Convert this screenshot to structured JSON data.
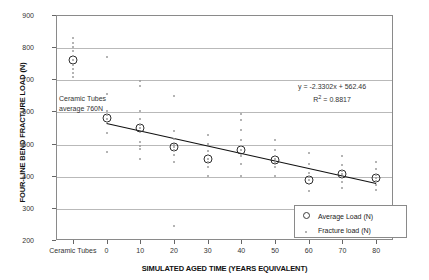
{
  "chart_data": {
    "type": "scatter",
    "title": "",
    "xlabel": "SIMULATED AGED TIME (YEARS EQUIVALENT)",
    "ylabel": "FOUR-LINE BEND FRACTURE LOAD (N)",
    "ylim": [
      200,
      900
    ],
    "ytick_labels": [
      "900",
      "800",
      "700",
      "600",
      "500",
      "400",
      "300",
      "200"
    ],
    "ytick_values": [
      900,
      800,
      700,
      600,
      500,
      400,
      300,
      200
    ],
    "xtick_labels": [
      "Ceramic\nTubes",
      "0",
      "10",
      "20",
      "30",
      "40",
      "50",
      "60",
      "70",
      "80"
    ],
    "xtick_values": [
      "ceramic",
      0,
      10,
      20,
      30,
      40,
      50,
      60,
      70,
      80
    ],
    "grid": true,
    "legend_position": "bottom-right",
    "annotation": "Ceramic Tubes\naverage 760N",
    "trendline_equation": "y = -2.3302x + 562.46",
    "trendline_r2_prefix": "R",
    "trendline_r2_sup": "2",
    "trendline_r2_value": " = 0.8817",
    "trendline_slope": -2.3302,
    "trendline_intercept": 562.46,
    "trendline_r2": 0.8817,
    "series": [
      {
        "name": "Average Load (N)",
        "marker": "open-circle",
        "color": "#2e2e2e",
        "points": [
          {
            "x": "ceramic",
            "y": 760
          },
          {
            "x": 0,
            "y": 580
          },
          {
            "x": 10,
            "y": 547
          },
          {
            "x": 20,
            "y": 489
          },
          {
            "x": 30,
            "y": 452
          },
          {
            "x": 40,
            "y": 480
          },
          {
            "x": 50,
            "y": 448
          },
          {
            "x": 60,
            "y": 388
          },
          {
            "x": 70,
            "y": 406
          },
          {
            "x": 80,
            "y": 392
          }
        ]
      },
      {
        "name": "Fracture load (N)",
        "marker": "dot",
        "color": "#9b9b9b",
        "points": [
          {
            "x": "ceramic",
            "y": 828
          },
          {
            "x": "ceramic",
            "y": 812
          },
          {
            "x": "ceramic",
            "y": 800
          },
          {
            "x": "ceramic",
            "y": 789
          },
          {
            "x": "ceramic",
            "y": 772
          },
          {
            "x": "ceramic",
            "y": 760
          },
          {
            "x": "ceramic",
            "y": 746
          },
          {
            "x": "ceramic",
            "y": 733
          },
          {
            "x": "ceramic",
            "y": 720
          },
          {
            "x": "ceramic",
            "y": 707
          },
          {
            "x": 0,
            "y": 768
          },
          {
            "x": 0,
            "y": 653
          },
          {
            "x": 0,
            "y": 600
          },
          {
            "x": 0,
            "y": 588
          },
          {
            "x": 0,
            "y": 578
          },
          {
            "x": 0,
            "y": 566
          },
          {
            "x": 0,
            "y": 532
          },
          {
            "x": 0,
            "y": 473
          },
          {
            "x": 10,
            "y": 694
          },
          {
            "x": 10,
            "y": 678
          },
          {
            "x": 10,
            "y": 600
          },
          {
            "x": 10,
            "y": 578
          },
          {
            "x": 10,
            "y": 559
          },
          {
            "x": 10,
            "y": 547
          },
          {
            "x": 10,
            "y": 506
          },
          {
            "x": 10,
            "y": 493
          },
          {
            "x": 10,
            "y": 484
          },
          {
            "x": 10,
            "y": 452
          },
          {
            "x": 20,
            "y": 647
          },
          {
            "x": 20,
            "y": 540
          },
          {
            "x": 20,
            "y": 513
          },
          {
            "x": 20,
            "y": 497
          },
          {
            "x": 20,
            "y": 489
          },
          {
            "x": 20,
            "y": 481
          },
          {
            "x": 20,
            "y": 463
          },
          {
            "x": 20,
            "y": 442
          },
          {
            "x": 20,
            "y": 243
          },
          {
            "x": 30,
            "y": 528
          },
          {
            "x": 30,
            "y": 500
          },
          {
            "x": 30,
            "y": 478
          },
          {
            "x": 30,
            "y": 463
          },
          {
            "x": 30,
            "y": 452
          },
          {
            "x": 30,
            "y": 443
          },
          {
            "x": 30,
            "y": 428
          },
          {
            "x": 30,
            "y": 400
          },
          {
            "x": 40,
            "y": 591
          },
          {
            "x": 40,
            "y": 572
          },
          {
            "x": 40,
            "y": 543
          },
          {
            "x": 40,
            "y": 512
          },
          {
            "x": 40,
            "y": 494
          },
          {
            "x": 40,
            "y": 480
          },
          {
            "x": 40,
            "y": 462
          },
          {
            "x": 40,
            "y": 437
          },
          {
            "x": 40,
            "y": 400
          },
          {
            "x": 50,
            "y": 512
          },
          {
            "x": 50,
            "y": 480
          },
          {
            "x": 50,
            "y": 462
          },
          {
            "x": 50,
            "y": 452
          },
          {
            "x": 50,
            "y": 443
          },
          {
            "x": 50,
            "y": 428
          },
          {
            "x": 50,
            "y": 400
          },
          {
            "x": 60,
            "y": 470
          },
          {
            "x": 60,
            "y": 437
          },
          {
            "x": 60,
            "y": 410
          },
          {
            "x": 60,
            "y": 395
          },
          {
            "x": 60,
            "y": 386
          },
          {
            "x": 60,
            "y": 374
          },
          {
            "x": 60,
            "y": 352
          },
          {
            "x": 70,
            "y": 462
          },
          {
            "x": 70,
            "y": 433
          },
          {
            "x": 70,
            "y": 416
          },
          {
            "x": 70,
            "y": 406
          },
          {
            "x": 70,
            "y": 397
          },
          {
            "x": 70,
            "y": 382
          },
          {
            "x": 70,
            "y": 361
          },
          {
            "x": 80,
            "y": 443
          },
          {
            "x": 80,
            "y": 420
          },
          {
            "x": 80,
            "y": 403
          },
          {
            "x": 80,
            "y": 394
          },
          {
            "x": 80,
            "y": 385
          },
          {
            "x": 80,
            "y": 372
          },
          {
            "x": 80,
            "y": 356
          }
        ]
      }
    ]
  }
}
